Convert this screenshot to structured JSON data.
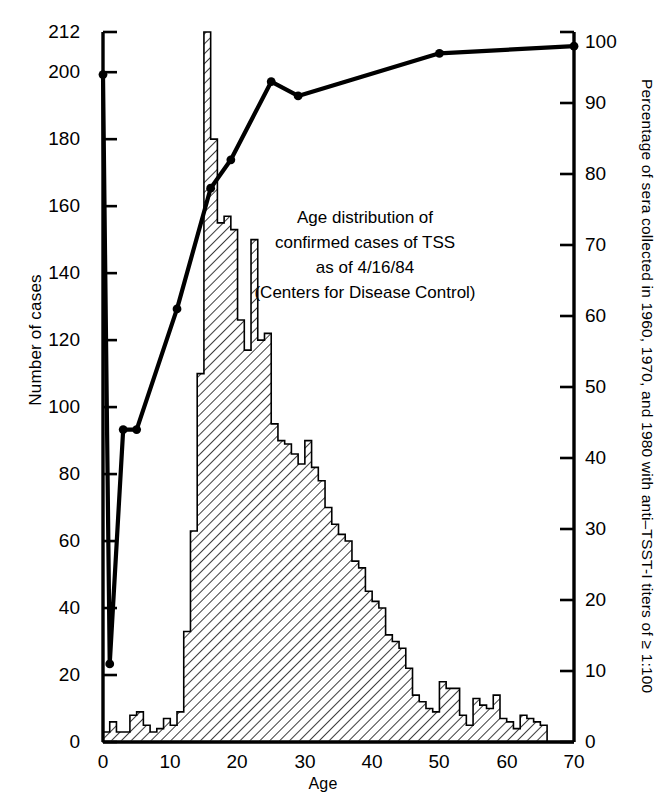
{
  "figure": {
    "annotation_lines": [
      "Age distribution of",
      "confirmed cases of TSS",
      "as of 4/16/84",
      "(Centers for Disease Control)"
    ]
  },
  "axes": {
    "left_title": "Number of cases",
    "right_title": "Percentage of sera collected in 1960, 1970, and 1980 with anti–TSST-I titers of ≥ 1:100",
    "x_title": "Age",
    "left_ticks": [
      "0",
      "20",
      "40",
      "60",
      "80",
      "100",
      "120",
      "140",
      "160",
      "180",
      "200",
      "212"
    ],
    "right_ticks": [
      "0",
      "10",
      "20",
      "30",
      "40",
      "50",
      "60",
      "70",
      "80",
      "90",
      "100"
    ],
    "x_ticks": [
      "0",
      "10",
      "20",
      "30",
      "40",
      "50",
      "60",
      "70"
    ]
  },
  "chart_data": {
    "type": "bar",
    "xlabel": "Age",
    "ylabel": "Number of cases",
    "y2label": "Percentage of sera collected in 1960, 1970, and 1980 with anti-TSST-I titers of ≥ 1:100",
    "xlim": [
      0,
      70
    ],
    "ylim": [
      0,
      212
    ],
    "y2lim": [
      0,
      100
    ],
    "grid": false,
    "legend": "none",
    "bar_width_years": 1,
    "categories": [
      0,
      1,
      2,
      3,
      4,
      5,
      6,
      7,
      8,
      9,
      10,
      11,
      12,
      13,
      14,
      15,
      16,
      17,
      18,
      19,
      20,
      21,
      22,
      23,
      24,
      25,
      26,
      27,
      28,
      29,
      30,
      31,
      32,
      33,
      34,
      35,
      36,
      37,
      38,
      39,
      40,
      41,
      42,
      43,
      44,
      45,
      46,
      47,
      48,
      49,
      50,
      51,
      52,
      53,
      54,
      55,
      56,
      57,
      58,
      59,
      60,
      61,
      62,
      63,
      64,
      65,
      66,
      67,
      68,
      69
    ],
    "series": [
      {
        "name": "Number of cases",
        "axis": "left",
        "type": "bar",
        "values": [
          3,
          6,
          3,
          3,
          8,
          9,
          5,
          3,
          4,
          7,
          5,
          9,
          33,
          63,
          110,
          212,
          180,
          155,
          157,
          153,
          126,
          117,
          150,
          120,
          122,
          95,
          90,
          89,
          86,
          83,
          90,
          82,
          78,
          70,
          65,
          62,
          60,
          54,
          52,
          45,
          42,
          40,
          32,
          30,
          28,
          22,
          14,
          12,
          10,
          9,
          18,
          16,
          16,
          8,
          5,
          13,
          11,
          10,
          14,
          7,
          6,
          4,
          8,
          7,
          6,
          5,
          0,
          0,
          0,
          0
        ]
      },
      {
        "name": "Percentage of sera with anti-TSST-I titers ≥ 1:100",
        "axis": "right",
        "type": "line",
        "marker": "filled-circle",
        "x": [
          0,
          1,
          3,
          5,
          11,
          16,
          19,
          25,
          29,
          50,
          70
        ],
        "values": [
          94,
          11,
          44,
          44,
          61,
          78,
          82,
          93,
          91,
          97,
          98
        ]
      }
    ]
  }
}
